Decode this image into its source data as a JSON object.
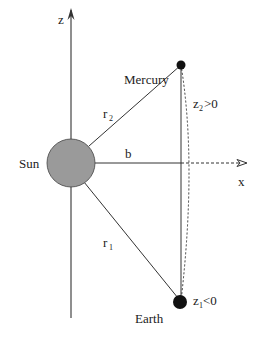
{
  "diagram": {
    "axes": {
      "z_label": "z",
      "x_label": "x"
    },
    "bodies": {
      "sun": {
        "label": "Sun",
        "fill": "#9a9a9a"
      },
      "mercury": {
        "label": "Mercury",
        "fill": "#111111"
      },
      "earth": {
        "label": "Earth",
        "fill": "#111111"
      }
    },
    "distances": {
      "r2": {
        "base": "r",
        "sub": "2"
      },
      "r1": {
        "base": "r",
        "sub": "1"
      },
      "b": "b"
    },
    "conditions": {
      "z2": {
        "base": "z",
        "sub": "2",
        "rel": ">0"
      },
      "z1": {
        "base": "z",
        "sub": "1",
        "rel": "<0"
      }
    }
  }
}
